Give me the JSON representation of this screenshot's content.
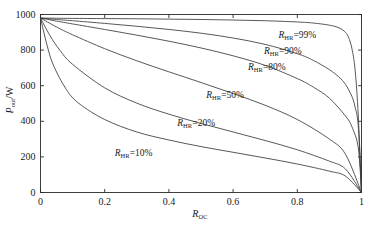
{
  "chart_data": {
    "type": "line",
    "title": "",
    "xlabel": "R_OC",
    "ylabel": "P_out/W",
    "xlabel_base": "R",
    "xlabel_sub": "OC",
    "ylabel_base": "P",
    "ylabel_sub": "out",
    "ylabel_unit": "/W",
    "xlim": [
      0,
      1
    ],
    "ylim": [
      0,
      1000
    ],
    "xticks": [
      "0",
      "0.2",
      "0.4",
      "0.6",
      "0.8",
      "1"
    ],
    "xtick_values": [
      0,
      0.2,
      0.4,
      0.6,
      0.8,
      1
    ],
    "yticks": [
      "0",
      "200",
      "400",
      "600",
      "800",
      "1000"
    ],
    "ytick_values": [
      0,
      200,
      400,
      600,
      800,
      1000
    ],
    "grid": false,
    "legend_position": "inline-annotations",
    "line_color": "#3a3a3a",
    "axis_color": "#2a2a2a",
    "background": "#ffffff",
    "series": [
      {
        "name": "R_HR=99%",
        "label_base": "R",
        "label_sub": "HR",
        "label_value": "=99%",
        "label_x": 0.8,
        "label_y": 880,
        "x": [
          0,
          0.05,
          0.1,
          0.2,
          0.3,
          0.4,
          0.5,
          0.6,
          0.7,
          0.8,
          0.85,
          0.9,
          0.93,
          0.95,
          0.96,
          0.97,
          0.98,
          0.99,
          1
        ],
        "values": [
          980,
          979,
          978,
          977,
          976,
          974,
          972,
          969,
          965,
          958,
          952,
          940,
          925,
          900,
          870,
          810,
          690,
          430,
          0
        ]
      },
      {
        "name": "R_HR=90%",
        "label_base": "R",
        "label_sub": "HR",
        "label_value": "=90%",
        "label_x": 0.755,
        "label_y": 790,
        "x": [
          0,
          0.05,
          0.1,
          0.2,
          0.3,
          0.4,
          0.5,
          0.6,
          0.7,
          0.8,
          0.85,
          0.9,
          0.93,
          0.95,
          0.97,
          0.98,
          0.99,
          1
        ],
        "values": [
          980,
          972,
          965,
          950,
          934,
          916,
          895,
          868,
          832,
          780,
          742,
          690,
          648,
          608,
          540,
          480,
          370,
          0
        ]
      },
      {
        "name": "R_HR=80%",
        "label_base": "R",
        "label_sub": "HR",
        "label_value": "=80%",
        "label_x": 0.705,
        "label_y": 700,
        "x": [
          0,
          0.05,
          0.1,
          0.2,
          0.3,
          0.4,
          0.5,
          0.6,
          0.7,
          0.8,
          0.85,
          0.9,
          0.95,
          0.97,
          0.99,
          1
        ],
        "values": [
          980,
          963,
          947,
          916,
          884,
          850,
          812,
          768,
          714,
          640,
          592,
          530,
          430,
          370,
          250,
          0
        ]
      },
      {
        "name": "R_HR=50%",
        "label_base": "R",
        "label_sub": "HR",
        "label_value": "=50%",
        "label_x": 0.575,
        "label_y": 540,
        "x": [
          0,
          0.05,
          0.1,
          0.2,
          0.3,
          0.4,
          0.5,
          0.6,
          0.7,
          0.8,
          0.9,
          0.95,
          1
        ],
        "values": [
          980,
          930,
          886,
          808,
          740,
          678,
          618,
          556,
          490,
          410,
          300,
          215,
          0
        ]
      },
      {
        "name": "R_HR=20%",
        "label_base": "R",
        "label_sub": "HR",
        "label_value": "=20%",
        "label_x": 0.485,
        "label_y": 385,
        "x": [
          0,
          0.03,
          0.06,
          0.1,
          0.2,
          0.3,
          0.4,
          0.5,
          0.6,
          0.7,
          0.8,
          0.9,
          0.95,
          1
        ],
        "values": [
          980,
          880,
          800,
          720,
          588,
          502,
          440,
          388,
          340,
          292,
          240,
          176,
          132,
          0
        ]
      },
      {
        "name": "R_HR=10%",
        "label_base": "R",
        "label_sub": "HR",
        "label_value": "=10%",
        "label_x": 0.29,
        "label_y": 215,
        "x": [
          0,
          0.02,
          0.04,
          0.08,
          0.12,
          0.2,
          0.3,
          0.4,
          0.5,
          0.6,
          0.7,
          0.8,
          0.9,
          0.95,
          1
        ],
        "values": [
          980,
          830,
          716,
          580,
          500,
          410,
          340,
          295,
          258,
          226,
          194,
          160,
          120,
          92,
          0
        ]
      }
    ]
  }
}
